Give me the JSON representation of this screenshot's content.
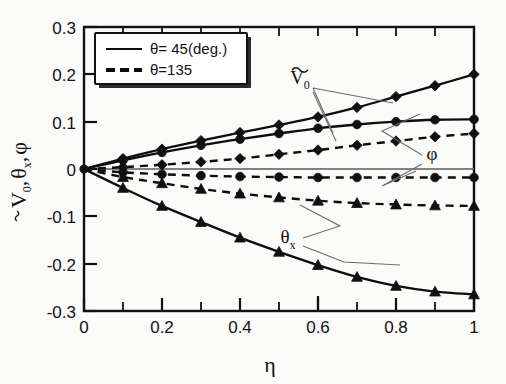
{
  "figure": {
    "background_color": "#fbfbfa",
    "ink_color": "#101010"
  },
  "axes": {
    "x_title": "η",
    "y_title_parts": {
      "v0": "V",
      "v0_sub": "0",
      "theta": "θ",
      "theta_sub": "x",
      "phi": "φ",
      "comma1": ",",
      "comma2": ","
    },
    "x_ticks": [
      "0",
      "0.2",
      "0.4",
      "0.6",
      "0.8",
      "1"
    ],
    "y_ticks": [
      "0.3",
      "0.2",
      "0.1",
      "0",
      "-0.1",
      "-0.2",
      "-0.3"
    ]
  },
  "legend": {
    "entries": [
      {
        "label": "θ= 45(deg.)",
        "style": "solid"
      },
      {
        "label": "θ=135",
        "style": "dashed"
      }
    ]
  },
  "annotations": [
    {
      "name": "v0-annotation",
      "base": "V",
      "sub": "0",
      "tilde": true
    },
    {
      "name": "phi-annotation",
      "base": "φ",
      "sub": "",
      "tilde": false
    },
    {
      "name": "thetax-annotation",
      "base": "θ",
      "sub": "x",
      "tilde": false
    }
  ],
  "chart_data": {
    "type": "line",
    "title": "",
    "xlabel": "η",
    "ylabel": "Ṽ₀, θₓ, φ",
    "xlim": [
      0,
      1
    ],
    "ylim": [
      -0.3,
      0.3
    ],
    "grid": false,
    "legend_position": "top-left-inside",
    "x": [
      0,
      0.1,
      0.2,
      0.3,
      0.4,
      0.5,
      0.6,
      0.7,
      0.8,
      0.9,
      1.0
    ],
    "series": [
      {
        "name": "V0-tilde, theta=45",
        "quantity": "V0-tilde",
        "theta_deg": 45,
        "style": "solid",
        "marker": "diamond",
        "values": [
          0,
          0.022,
          0.042,
          0.06,
          0.077,
          0.093,
          0.11,
          0.13,
          0.153,
          0.176,
          0.2
        ]
      },
      {
        "name": "phi, theta=45",
        "quantity": "phi",
        "theta_deg": 45,
        "style": "solid",
        "marker": "circle",
        "values": [
          0,
          0.018,
          0.035,
          0.05,
          0.063,
          0.075,
          0.086,
          0.094,
          0.1,
          0.104,
          0.105
        ]
      },
      {
        "name": "theta_x, theta=45",
        "quantity": "theta_x",
        "theta_deg": 45,
        "style": "solid",
        "marker": "triangle",
        "values": [
          0,
          -0.04,
          -0.078,
          -0.112,
          -0.145,
          -0.175,
          -0.203,
          -0.228,
          -0.247,
          -0.259,
          -0.265
        ]
      },
      {
        "name": "V0-tilde, theta=135",
        "quantity": "V0-tilde",
        "theta_deg": 135,
        "style": "dashed",
        "marker": "diamond",
        "values": [
          0,
          0.004,
          0.009,
          0.015,
          0.022,
          0.031,
          0.04,
          0.05,
          0.059,
          0.068,
          0.075
        ]
      },
      {
        "name": "phi, theta=135",
        "quantity": "phi",
        "theta_deg": 135,
        "style": "dashed",
        "marker": "circle",
        "values": [
          0,
          -0.007,
          -0.011,
          -0.014,
          -0.016,
          -0.017,
          -0.018,
          -0.018,
          -0.018,
          -0.018,
          -0.018
        ]
      },
      {
        "name": "theta_x, theta=135",
        "quantity": "theta_x",
        "theta_deg": 135,
        "style": "dashed",
        "marker": "triangle",
        "values": [
          0,
          -0.017,
          -0.03,
          -0.042,
          -0.052,
          -0.06,
          -0.067,
          -0.072,
          -0.075,
          -0.077,
          -0.078
        ]
      }
    ]
  }
}
